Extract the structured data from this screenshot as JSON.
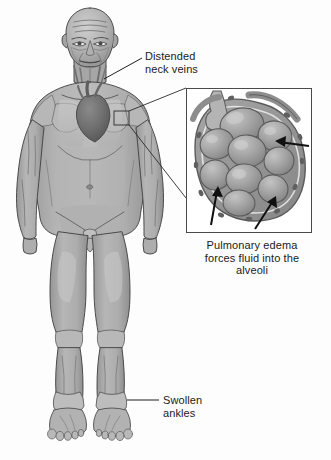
{
  "figure": {
    "background_color": "#fdfdfd"
  },
  "labels": {
    "neck_veins": "Distended\nneck veins",
    "swollen_ankles": "Swollen\nankles",
    "alveoli_caption": "Pulmonary edema\nforces fluid into the\nalveoli"
  },
  "inset": {
    "border_color": "#4a4a4a",
    "background": "#ffffff",
    "x": 186,
    "y": 88,
    "width": 126,
    "height": 145,
    "content": "alveolar sac cluster with surrounding capillary membrane",
    "arrow_count": 3,
    "arrow_color": "#101010",
    "arrow_meaning": "fluid forced into alveoli"
  },
  "callout": {
    "chest_marker_label": "chest region magnified",
    "marker_x": 114,
    "marker_y": 111,
    "marker_width": 15,
    "marker_height": 14,
    "line_color": "#2a2a2a"
  },
  "palette": {
    "skin_base": "#a9a9a9",
    "skin_light": "#c9c9c9",
    "skin_highlight": "#dcdcdc",
    "skin_shadow": "#8d8d8d",
    "outline": "#3d3d3d",
    "heart_dark": "#6f6f6f",
    "heart_shadow": "#5a5a5a",
    "lung_light": "#c4c4c4",
    "alveoli_fill": "#9d9d9d",
    "alveoli_light": "#b8b8b8",
    "membrane": "#8a8a8a",
    "text": "#1b1b1b"
  },
  "anatomy_markers": [
    {
      "name": "distended-neck-veins",
      "region": "neck"
    },
    {
      "name": "enlarged-heart",
      "region": "thorax"
    },
    {
      "name": "lungs",
      "region": "thorax"
    },
    {
      "name": "swollen-ankles",
      "region": "lower-legs"
    }
  ]
}
